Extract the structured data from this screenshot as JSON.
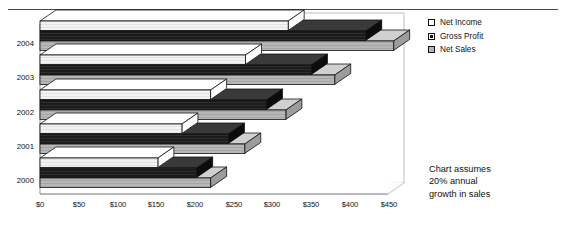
{
  "chart_data": {
    "type": "bar",
    "orientation": "horizontal",
    "style": "3d-clustered",
    "title": "",
    "xlabel": "",
    "ylabel": "",
    "categories": [
      "2004",
      "2003",
      "2002",
      "2001",
      "2000"
    ],
    "series": [
      {
        "name": "Net Income",
        "color": "#ffffff",
        "values": [
          320,
          265,
          220,
          183,
          152
        ]
      },
      {
        "name": "Gross Profit",
        "color": "#111111",
        "values": [
          420,
          350,
          292,
          243,
          202
        ]
      },
      {
        "name": "Net Sales",
        "color": "#b5b5b5",
        "values": [
          456,
          380,
          317,
          264,
          220
        ]
      }
    ],
    "xlim": [
      0,
      450
    ],
    "xtick_values": [
      0,
      50,
      100,
      150,
      200,
      250,
      300,
      350,
      400,
      450
    ],
    "xtick_labels": [
      "$0",
      "$50",
      "$100",
      "$150",
      "$200",
      "$250",
      "$300",
      "$350",
      "$400",
      "$450"
    ],
    "grid": false,
    "legend_position": "top-right",
    "value_prefix": "$"
  },
  "legend": {
    "items": [
      {
        "label": "Net Income",
        "swatch": "netincome"
      },
      {
        "label": "Gross Profit",
        "swatch": "grossprofit"
      },
      {
        "label": "Net Sales",
        "swatch": "netsales"
      }
    ]
  },
  "annotation": {
    "line1": "Chart assumes",
    "line2": "20% annual",
    "line3": "growth in sales"
  }
}
